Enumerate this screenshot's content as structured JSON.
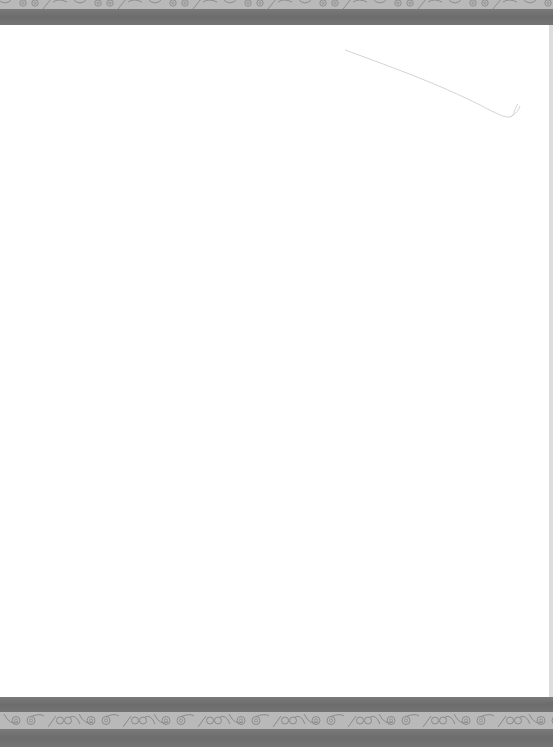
{
  "page": {
    "background": "#ffffff",
    "top_border": {
      "pattern_strip": {
        "color": "#b9b9b9",
        "motif_color": "#8a8a8a",
        "motif": "spiral-wave"
      },
      "dark_band": {
        "color": "#707070"
      }
    },
    "bottom_border": {
      "dark_band_upper": {
        "color": "#707070"
      },
      "pattern_strip": {
        "color": "#b9b9b9",
        "motif_color": "#8a8a8a",
        "motif": "spiral-wave"
      },
      "dark_band_lower": {
        "color": "#6e6e6e"
      }
    },
    "decoration": {
      "stroke_color": "#d6d6d6"
    }
  }
}
